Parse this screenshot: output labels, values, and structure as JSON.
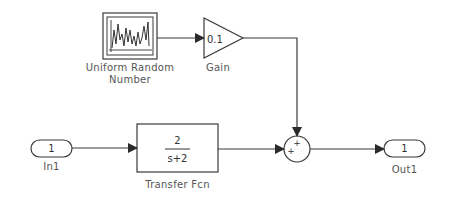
{
  "diagram": {
    "type": "simulink-block-diagram",
    "colors": {
      "stroke": "#3a3a3a",
      "label": "#555555",
      "background": "#ffffff"
    },
    "blocks": {
      "random": {
        "name": "Uniform Random Number",
        "label_line1": "Uniform Random",
        "label_line2": "Number",
        "icon": "noise-signal-icon"
      },
      "gain": {
        "name": "Gain",
        "label": "Gain",
        "value": "0.1"
      },
      "inport": {
        "name": "In1",
        "label": "In1",
        "port": "1"
      },
      "tf": {
        "name": "Transfer Fcn",
        "label": "Transfer Fcn",
        "numerator": "2",
        "denominator": "s+2"
      },
      "sum": {
        "name": "Sum",
        "signs": [
          "+",
          "+"
        ]
      },
      "outport": {
        "name": "Out1",
        "label": "Out1",
        "port": "1"
      }
    },
    "connections": [
      {
        "from": "Uniform Random Number",
        "to": "Gain"
      },
      {
        "from": "Gain",
        "to": "Sum"
      },
      {
        "from": "In1",
        "to": "Transfer Fcn"
      },
      {
        "from": "Transfer Fcn",
        "to": "Sum"
      },
      {
        "from": "Sum",
        "to": "Out1"
      }
    ]
  }
}
